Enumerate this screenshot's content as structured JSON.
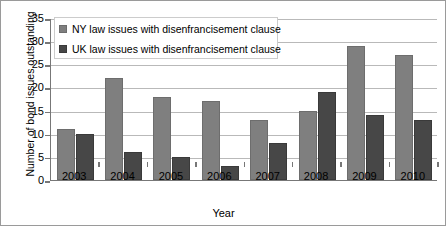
{
  "chart_data": {
    "type": "bar",
    "title": "",
    "subtitle": "",
    "xlabel": "Year",
    "ylabel": "Number of bond issues outstanding",
    "categories": [
      "2003",
      "2004",
      "2005",
      "2006",
      "2007",
      "2008",
      "2009",
      "2010"
    ],
    "series": [
      {
        "name": "NY law issues with disenfrancisement clause",
        "color": "#7f7f7f",
        "values": [
          11,
          22,
          18,
          17,
          13,
          15,
          29,
          27
        ]
      },
      {
        "name": "UK law issues with disenfrancisement clause",
        "color": "#474747",
        "values": [
          10,
          6,
          5,
          3,
          8,
          19,
          14,
          13
        ]
      }
    ],
    "ylim": [
      0,
      35
    ],
    "ytick_labels": [
      "0",
      "5",
      "10",
      "15",
      "20",
      "25",
      "30",
      "35"
    ],
    "ytick_values": [
      0,
      5,
      10,
      15,
      20,
      25,
      30,
      35
    ],
    "grid": true,
    "legend_position": "top-left"
  }
}
